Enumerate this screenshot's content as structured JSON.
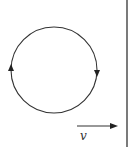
{
  "diagram": {
    "loop": {
      "direction": "clockwise",
      "arrows": [
        {
          "side": "left",
          "points": "up"
        },
        {
          "side": "right",
          "points": "down"
        }
      ]
    },
    "velocity": {
      "label": "v",
      "direction": "right"
    },
    "boundary": {
      "orientation": "vertical"
    },
    "colors": {
      "stroke": "#333333",
      "background": "#ffffff"
    }
  }
}
